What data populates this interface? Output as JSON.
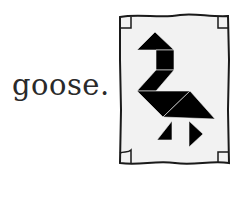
{
  "label": {
    "text": "goose."
  },
  "illustration": {
    "subject": "tangram goose",
    "frame": "parchment-scroll",
    "fill_color": "#000000",
    "paper_color": "#f2f2f2",
    "outline_color": "#1a1a1a"
  }
}
